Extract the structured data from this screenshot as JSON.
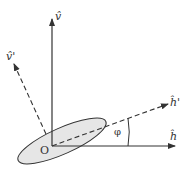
{
  "diagram": {
    "type": "coordinate-rotation",
    "origin_label": "O",
    "axes": [
      {
        "id": "v",
        "label": "v̂",
        "style": "solid",
        "direction": "vertical"
      },
      {
        "id": "h",
        "label": "ĥ",
        "style": "solid",
        "direction": "horizontal"
      },
      {
        "id": "v_prime",
        "label": "v̂'",
        "style": "dashed",
        "direction": "rotated-vertical"
      },
      {
        "id": "h_prime",
        "label": "ĥ'",
        "style": "dashed",
        "direction": "rotated-horizontal"
      }
    ],
    "angle_label": "φ",
    "ellipse": {
      "fill": "#e6e6e6",
      "stroke": "#333333"
    },
    "colors": {
      "line": "#333333",
      "background": "#ffffff"
    }
  }
}
